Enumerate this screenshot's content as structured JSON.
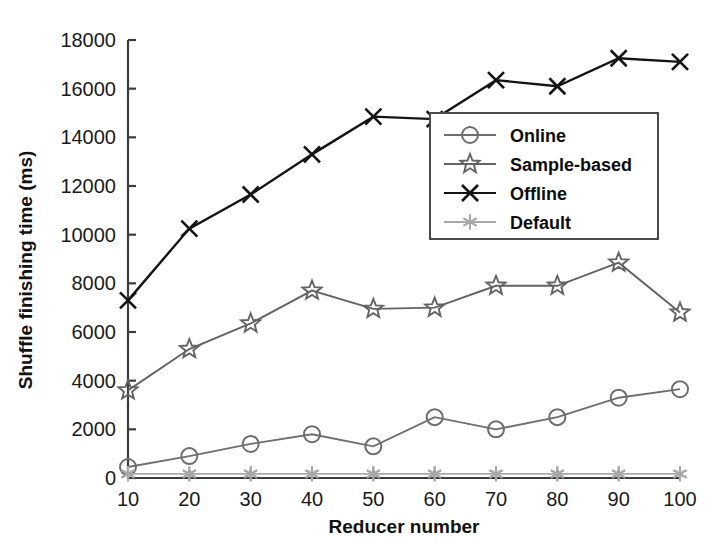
{
  "chart_data": {
    "type": "line",
    "title": "",
    "xlabel": "Reducer number",
    "ylabel": "Shuffle finishing time (ms)",
    "x": [
      10,
      20,
      30,
      40,
      50,
      60,
      70,
      80,
      90,
      100
    ],
    "xticklabels": [
      "10",
      "20",
      "30",
      "40",
      "50",
      "60",
      "70",
      "80",
      "90",
      "100"
    ],
    "yticklabels": [
      "0",
      "2000",
      "4000",
      "6000",
      "8000",
      "10000",
      "12000",
      "14000",
      "16000",
      "18000"
    ],
    "yticks": [
      0,
      2000,
      4000,
      6000,
      8000,
      10000,
      12000,
      14000,
      16000,
      18000
    ],
    "xlim": [
      10,
      100
    ],
    "ylim": [
      0,
      18000
    ],
    "grid": false,
    "legend_position": "center-right",
    "series": [
      {
        "name": "Online",
        "marker": "circle-marker",
        "color": "#6e6e6e",
        "values": [
          450,
          900,
          1400,
          1800,
          1300,
          2500,
          2000,
          2500,
          3300,
          3650
        ]
      },
      {
        "name": "Sample-based",
        "marker": "star-marker",
        "color": "#636363",
        "values": [
          3600,
          5300,
          6350,
          7700,
          6950,
          7000,
          7900,
          7900,
          8850,
          6800
        ]
      },
      {
        "name": "Offline",
        "marker": "x-marker",
        "color": "#141414",
        "values": [
          7300,
          10250,
          11650,
          13300,
          14850,
          14750,
          16350,
          16100,
          17250,
          17100
        ]
      },
      {
        "name": "Default",
        "marker": "asterisk-marker",
        "color": "#a8a8a8",
        "values": [
          170,
          170,
          170,
          170,
          170,
          170,
          170,
          170,
          170,
          170
        ]
      }
    ]
  },
  "legend": {
    "entries": [
      {
        "label": "Online"
      },
      {
        "label": "Sample-based"
      },
      {
        "label": "Offline"
      },
      {
        "label": "Default"
      }
    ]
  },
  "colors": {
    "axis": "#3c3c3c",
    "background": "#ffffff",
    "legend_border": "#4a4a4a",
    "text": "#111111"
  }
}
